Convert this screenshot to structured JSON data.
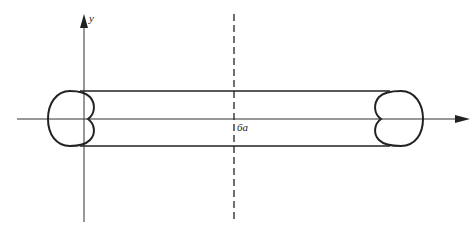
{
  "diagram": {
    "labels": {
      "y_axis": "y",
      "distance": "6a"
    },
    "elements": [
      "x-axis with arrow",
      "y-axis with arrow",
      "dashed vertical line at midpoint",
      "left cardioid cross-section",
      "right cardioid cross-section",
      "top tangent line",
      "bottom tangent line"
    ],
    "colors": {
      "stroke": "#222222",
      "background": "#ffffff"
    }
  }
}
